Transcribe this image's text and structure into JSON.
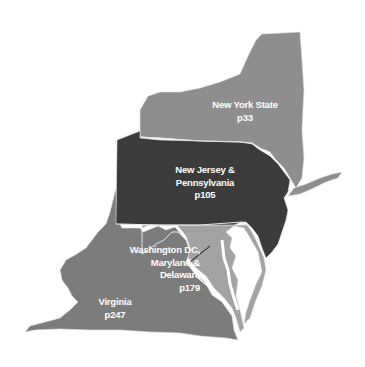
{
  "map": {
    "title": "Regional map",
    "colors": {
      "new_york": "#8e8e8e",
      "nj_pa": "#3b3b3b",
      "md_de_dc": "#a3a3a3",
      "virginia": "#7c7c7c",
      "border": "#e6e6e6",
      "label": "#ffffff"
    },
    "regions": [
      {
        "id": "new-york",
        "name_lines": [
          "New York State"
        ],
        "page": "p33"
      },
      {
        "id": "nj-pa",
        "name_lines": [
          "New Jersey &",
          "Pennsylvania"
        ],
        "page": "p105"
      },
      {
        "id": "md-de-dc",
        "name_lines": [
          "Washington DC,",
          "Maryland &",
          "Delaware"
        ],
        "page": "p179"
      },
      {
        "id": "virginia",
        "name_lines": [
          "Virginia"
        ],
        "page": "p247"
      }
    ]
  }
}
